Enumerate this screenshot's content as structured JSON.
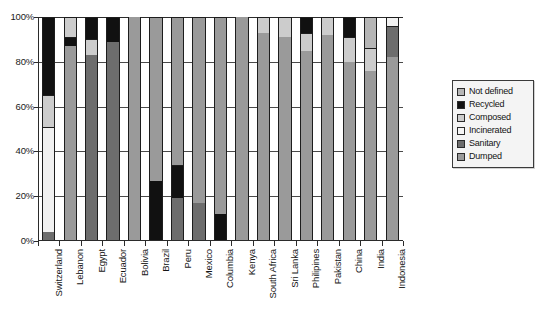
{
  "chart_data": {
    "type": "bar",
    "subtype": "stacked-percent",
    "title": "",
    "xlabel": "",
    "ylabel": "",
    "ylim": [
      0,
      100
    ],
    "ytick_labels": [
      "0%",
      "20%",
      "40%",
      "60%",
      "80%",
      "100%"
    ],
    "ytick_values": [
      0,
      20,
      40,
      60,
      80,
      100
    ],
    "grid": true,
    "legend_position": "right",
    "categories": [
      "Switzerland",
      "Lebanon",
      "Egypt",
      "Ecuador",
      "Bolivia",
      "Brazil",
      "Peru",
      "Mexico",
      "Columbia",
      "Kenya",
      "South Africa",
      "Sri Lanka",
      "Philipines",
      "Pakistan",
      "China",
      "India",
      "Indonesia"
    ],
    "series": [
      {
        "name": "Dumped",
        "color": "#9a9a9a",
        "values": [
          0,
          87,
          0,
          0,
          100,
          73,
          0,
          83,
          88,
          100,
          93,
          91,
          85,
          92,
          80,
          76,
          82
        ]
      },
      {
        "name": "Sanitary",
        "color": "#6d6d6d",
        "values": [
          4,
          0,
          83,
          89,
          0,
          0,
          81,
          17,
          0,
          0,
          0,
          0,
          0,
          0,
          0,
          0,
          14
        ]
      },
      {
        "name": "Incinerated",
        "color": "#f1f1f1",
        "values": [
          47,
          0,
          0,
          0,
          0,
          0,
          0,
          0,
          0,
          0,
          0,
          0,
          0,
          0,
          0,
          0,
          4
        ]
      },
      {
        "name": "Composed",
        "color": "#cccccc",
        "values": [
          14,
          9,
          7,
          0,
          0,
          0,
          0,
          0,
          0,
          0,
          7,
          9,
          8,
          8,
          11,
          10,
          0
        ]
      },
      {
        "name": "Recycled",
        "color": "#111111",
        "values": [
          35,
          4,
          10,
          11,
          0,
          27,
          19,
          0,
          12,
          0,
          0,
          0,
          7,
          0,
          9,
          0,
          0
        ]
      },
      {
        "name": "Not defined",
        "color": "#b6b6b6",
        "values": [
          0,
          0,
          0,
          0,
          0,
          0,
          0,
          0,
          0,
          0,
          0,
          0,
          0,
          0,
          0,
          14,
          0
        ]
      }
    ],
    "stack_order": [
      "Dumped",
      "Sanitary",
      "Incinerated",
      "Composed",
      "Recycled",
      "Not defined"
    ],
    "bars": [
      {
        "category": "Switzerland",
        "segments": [
          {
            "name": "Sanitary",
            "value": 4
          },
          {
            "name": "Incinerated",
            "value": 47
          },
          {
            "name": "Composed",
            "value": 14
          },
          {
            "name": "Recycled",
            "value": 35
          }
        ]
      },
      {
        "category": "Lebanon",
        "segments": [
          {
            "name": "Dumped",
            "value": 87
          },
          {
            "name": "Recycled",
            "value": 4
          },
          {
            "name": "Composed",
            "value": 9
          }
        ]
      },
      {
        "category": "Egypt",
        "segments": [
          {
            "name": "Sanitary",
            "value": 83
          },
          {
            "name": "Composed",
            "value": 7
          },
          {
            "name": "Recycled",
            "value": 10
          }
        ]
      },
      {
        "category": "Ecuador",
        "segments": [
          {
            "name": "Sanitary",
            "value": 89
          },
          {
            "name": "Recycled",
            "value": 11
          }
        ]
      },
      {
        "category": "Bolivia",
        "segments": [
          {
            "name": "Dumped",
            "value": 100
          }
        ]
      },
      {
        "category": "Brazil",
        "segments": [
          {
            "name": "Recycled",
            "value": 27
          },
          {
            "name": "Dumped",
            "value": 73
          }
        ]
      },
      {
        "category": "Peru",
        "segments": [
          {
            "name": "Sanitary",
            "value": 19
          },
          {
            "name": "Recycled",
            "value": 15
          },
          {
            "name": "Dumped",
            "value": 66
          }
        ]
      },
      {
        "category": "Mexico",
        "segments": [
          {
            "name": "Sanitary",
            "value": 17
          },
          {
            "name": "Dumped",
            "value": 83
          }
        ]
      },
      {
        "category": "Columbia",
        "segments": [
          {
            "name": "Recycled",
            "value": 12
          },
          {
            "name": "Dumped",
            "value": 88
          }
        ]
      },
      {
        "category": "Kenya",
        "segments": [
          {
            "name": "Dumped",
            "value": 100
          }
        ]
      },
      {
        "category": "South Africa",
        "segments": [
          {
            "name": "Dumped",
            "value": 93
          },
          {
            "name": "Composed",
            "value": 7
          }
        ]
      },
      {
        "category": "Sri Lanka",
        "segments": [
          {
            "name": "Dumped",
            "value": 91
          },
          {
            "name": "Composed",
            "value": 9
          }
        ]
      },
      {
        "category": "Philipines",
        "segments": [
          {
            "name": "Dumped",
            "value": 85
          },
          {
            "name": "Composed",
            "value": 8
          },
          {
            "name": "Recycled",
            "value": 7
          }
        ]
      },
      {
        "category": "Pakistan",
        "segments": [
          {
            "name": "Dumped",
            "value": 92
          },
          {
            "name": "Composed",
            "value": 8
          }
        ]
      },
      {
        "category": "China",
        "segments": [
          {
            "name": "Dumped",
            "value": 80
          },
          {
            "name": "Composed",
            "value": 11
          },
          {
            "name": "Recycled",
            "value": 9
          }
        ]
      },
      {
        "category": "India",
        "segments": [
          {
            "name": "Dumped",
            "value": 76
          },
          {
            "name": "Composed",
            "value": 10
          },
          {
            "name": "Not defined",
            "value": 14
          }
        ]
      },
      {
        "category": "Indonesia",
        "segments": [
          {
            "name": "Dumped",
            "value": 82
          },
          {
            "name": "Sanitary",
            "value": 14
          },
          {
            "name": "Incinerated",
            "value": 4
          }
        ]
      }
    ]
  },
  "legend": {
    "items": [
      {
        "label": "Not defined",
        "color": "#b6b6b6"
      },
      {
        "label": "Recycled",
        "color": "#111111"
      },
      {
        "label": "Composed",
        "color": "#cccccc"
      },
      {
        "label": "Incinerated",
        "color": "#f5f5f5"
      },
      {
        "label": "Sanitary",
        "color": "#6d6d6d"
      },
      {
        "label": "Dumped",
        "color": "#9a9a9a"
      }
    ]
  },
  "colors": {
    "axis": "#2b2b2b",
    "grid": "#4a4a4a",
    "background": "#ffffff",
    "legend_background": "#f4f4f4",
    "legend_border": "#3a3a3a"
  }
}
